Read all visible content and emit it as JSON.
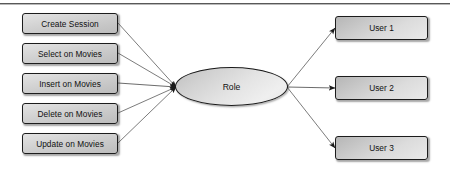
{
  "diagram": {
    "type": "node-edge-diagram",
    "center_node": {
      "label": "Role",
      "shape": "ellipse"
    },
    "permission_nodes": [
      {
        "label": "Create Session"
      },
      {
        "label": "Select on Movies"
      },
      {
        "label": "Insert on Movies"
      },
      {
        "label": "Delete on Movies"
      },
      {
        "label": "Update on Movies"
      }
    ],
    "user_nodes": [
      {
        "label": "User 1"
      },
      {
        "label": "User 2"
      },
      {
        "label": "User 3"
      }
    ],
    "colors": {
      "node_border": "#1c1c1c",
      "edge_line": "#6d6d6d",
      "arrow_fill": "#1a1a1a",
      "text": "#101010",
      "rule": "#585858"
    }
  }
}
